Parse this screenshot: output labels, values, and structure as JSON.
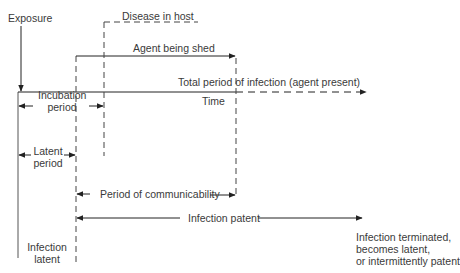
{
  "diagram": {
    "labels": {
      "exposure": "Exposure",
      "disease_in_host": "Disease in host",
      "agent_being_shed": "Agent being shed",
      "total_period": "Total period of infection (agent present)",
      "time": "Time",
      "incubation_line1": "Incubation",
      "incubation_line2": "period",
      "latent_line1": "Latent",
      "latent_line2": "period",
      "period_of_communicability": "Period of communicability",
      "infection_patent": "Infection patent",
      "infection_latent_line1": "Infection",
      "infection_latent_line2": "latent",
      "outcome_line1": "Infection terminated,",
      "outcome_line2": "becomes latent,",
      "outcome_line3": "or intermittently patent"
    },
    "colors": {
      "line": "#222222",
      "text": "#3a3a3a",
      "background": "#ffffff"
    }
  }
}
